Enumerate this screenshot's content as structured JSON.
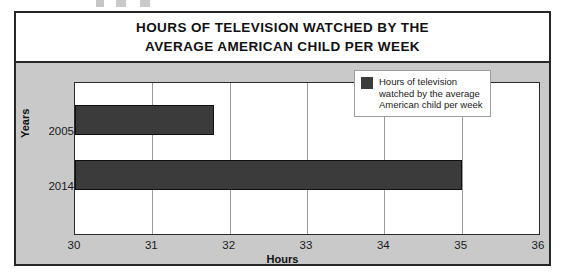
{
  "figure": {
    "title_lines": [
      "HOURS OF TELEVISION WATCHED BY THE",
      "AVERAGE AMERICAN CHILD PER WEEK"
    ],
    "plot_background": "#ffffff",
    "chart_background": "#c9c9c9",
    "bar_color": "#3b3b3b",
    "border_color": "#272727"
  },
  "legend": {
    "lines": [
      "Hours of television",
      "watched by the average",
      "American child per week"
    ],
    "swatch_color": "#3b3b3b"
  },
  "chart_data": {
    "type": "bar",
    "orientation": "horizontal",
    "title": "HOURS OF TELEVISION WATCHED BY THE AVERAGE AMERICAN CHILD PER WEEK",
    "categories": [
      "2005",
      "2014"
    ],
    "values": [
      31.8,
      35.0
    ],
    "series": [
      {
        "name": "Hours of television watched by the average American child per week",
        "values": [
          31.8,
          35.0
        ]
      }
    ],
    "xlabel": "Hours",
    "ylabel": "Years",
    "xlim": [
      30,
      36
    ],
    "xticks": [
      30,
      31,
      32,
      33,
      34,
      35,
      36
    ],
    "xtick_labels": [
      "30",
      "31",
      "32",
      "33",
      "34",
      "35",
      "36"
    ],
    "grid": true,
    "grid_axis": "x",
    "legend_position": "top-right"
  }
}
